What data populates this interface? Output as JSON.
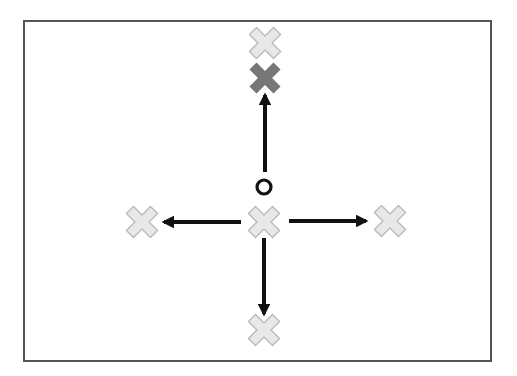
{
  "diagram": {
    "title": "",
    "frame": {
      "x": 24,
      "y": 21,
      "width": 467,
      "height": 340,
      "stroke": "#555555"
    },
    "colors": {
      "arrow": "#111111",
      "candidate_fill": "#e8e8e8",
      "candidate_stroke": "#bdbdbd",
      "selected_fill": "#777777",
      "origin_stroke": "#111111"
    },
    "origin_marker": {
      "shape": "circle",
      "cx": 264,
      "cy": 187,
      "r": 7
    },
    "markers": [
      {
        "id": "top-far",
        "cx": 265,
        "cy": 43,
        "state": "candidate"
      },
      {
        "id": "top",
        "cx": 265,
        "cy": 78,
        "state": "selected"
      },
      {
        "id": "center",
        "cx": 264,
        "cy": 222,
        "state": "candidate"
      },
      {
        "id": "left",
        "cx": 142,
        "cy": 222,
        "state": "candidate"
      },
      {
        "id": "right",
        "cx": 390,
        "cy": 221,
        "state": "candidate"
      },
      {
        "id": "bottom",
        "cx": 264,
        "cy": 330,
        "state": "candidate"
      }
    ],
    "arrows": [
      {
        "id": "up",
        "x1": 265,
        "y1": 172,
        "x2": 265,
        "y2": 95
      },
      {
        "id": "left",
        "x1": 241,
        "y1": 222,
        "x2": 164,
        "y2": 222
      },
      {
        "id": "right",
        "x1": 289,
        "y1": 221,
        "x2": 366,
        "y2": 221
      },
      {
        "id": "down",
        "x1": 264,
        "y1": 238,
        "x2": 264,
        "y2": 314
      }
    ]
  }
}
